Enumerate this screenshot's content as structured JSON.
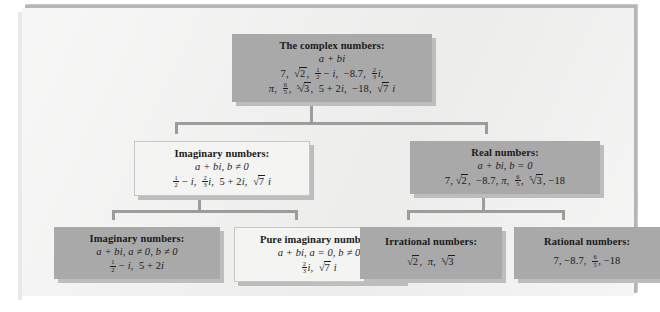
{
  "diagram": {
    "colors": {
      "page_background": "#ffffff",
      "panel_background": "#f1f1f0",
      "panel_border": "#b6b6b6",
      "node_fill_gray": "#a9a9a9",
      "node_fill_light": "#f4f4f3",
      "node_shadow": "#bdbdbd",
      "connector": "#9c9c9c",
      "text": "#1b1b1b"
    },
    "nodes": {
      "complex": {
        "style": "gray",
        "title": "The complex numbers:",
        "definition": "a + bi",
        "examples_line1": "7, √2, ½ − i, −8.7, ⅔i,",
        "examples_line2": "π, 6/5, ⁵√3, 5 + 2i, −18, √7 i"
      },
      "imaginary": {
        "style": "light",
        "title": "Imaginary numbers:",
        "definition": "a + bi, b ≠ 0",
        "examples": "½ − i, ⅔i, 5 + 2i, √7 i"
      },
      "real": {
        "style": "gray",
        "title": "Real numbers:",
        "definition": "a + bi, b = 0",
        "examples": "7, √2, −8.7, π, 6/5, ⁵√3, −18"
      },
      "imaginary_nonzero": {
        "style": "gray",
        "title": "Imaginary numbers:",
        "definition": "a + bi, a ≠ 0, b ≠ 0",
        "examples": "½ − i, 5 + 2i"
      },
      "pure_imaginary": {
        "style": "light",
        "title": "Pure imaginary numbers:",
        "definition": "a + bi, a = 0, b ≠ 0",
        "examples": "⅔i, √7 i"
      },
      "irrational": {
        "style": "gray",
        "title": "Irrational numbers:",
        "definition": "",
        "examples": "√2, π, ⁵√3"
      },
      "rational": {
        "style": "gray",
        "title": "Rational numbers:",
        "definition": "",
        "examples": "7, −8.7, 6/5, −18"
      }
    }
  }
}
